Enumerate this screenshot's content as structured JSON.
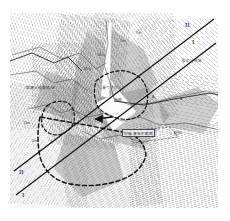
{
  "figure": {
    "type": "topographic-geologic-map",
    "background_color": "#ffffff",
    "plate_color": "#fdfdfd",
    "line_color": "#333333",
    "dashed_boundary_color": "#1a1a1a",
    "section_line_color": "#111111"
  },
  "section_lines": [
    {
      "id": "section-II",
      "label_top_right": "II",
      "label_bottom_left": "II"
    },
    {
      "id": "section-I",
      "label_top_right": "I",
      "label_bottom_left": "I"
    }
  ],
  "end_labels": {
    "top_right_upper": "II",
    "top_right_lower": "I",
    "bottom_left_upper": "II",
    "bottom_left_lower": "I"
  },
  "annotations": [
    {
      "id": "note-right",
      "text": "裂の分布域",
      "x": 182,
      "y": 58
    },
    {
      "id": "note-left",
      "text": "崩壊土砂堆積域",
      "x": 16,
      "y": 86
    },
    {
      "id": "note-center-top",
      "text": "滑りブロック",
      "x": 102,
      "y": 85
    },
    {
      "id": "note-center-mid",
      "text": "頭部",
      "x": 112,
      "y": 97
    },
    {
      "id": "note-box-lower",
      "text": "旧崩壊地形範囲",
      "x": 124,
      "y": 128
    },
    {
      "id": "note-box-small",
      "text": "転石",
      "x": 172,
      "y": 128
    },
    {
      "id": "note-tl-1",
      "text": "Dm",
      "x": 120,
      "y": 38
    },
    {
      "id": "note-tl-2",
      "text": "Tm",
      "x": 136,
      "y": 30
    },
    {
      "id": "note-tl-3",
      "text": "Mca",
      "x": 98,
      "y": 52
    },
    {
      "id": "note-tl-4",
      "text": "Mcg",
      "x": 84,
      "y": 66
    },
    {
      "id": "note-bl-1",
      "text": "Dm",
      "x": 22,
      "y": 120
    },
    {
      "id": "note-bl-2",
      "text": "Dm",
      "x": 30,
      "y": 138
    },
    {
      "id": "note-r-1",
      "text": "A",
      "x": 152,
      "y": 94
    },
    {
      "id": "note-r-2",
      "text": "A",
      "x": 180,
      "y": 96
    },
    {
      "id": "note-b-1",
      "text": "A",
      "x": 140,
      "y": 160
    }
  ],
  "map_features": {
    "contour_family_count": 9,
    "shaded_mass_count": 6,
    "dashed_polygon_count": 3,
    "arrow_markers": 2
  }
}
